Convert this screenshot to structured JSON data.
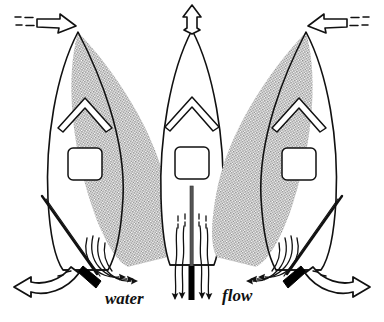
{
  "figure": {
    "caption_left_word": "water",
    "caption_right_word": "flow",
    "colors": {
      "ink": "#111111",
      "hull_stroke": "#111111",
      "shade_fill": "#9a9a9a",
      "background": "#ffffff",
      "rudder_fill": "#000000"
    }
  },
  "panels": [
    {
      "id": "left",
      "name": "boat-turning-left",
      "heading_arrow": "arrow-pointing-right-down-to-bow",
      "heading_arrow_style": "hollow-with-dashed-tail",
      "shaded_region": "swept-hull-rotated-counterclockwise",
      "rudder_state": "deflected-to-starboard",
      "turn_arrow": "curved-arrow-pointing-left",
      "deck_detail": "chevron",
      "cockpit": "square-cockpit"
    },
    {
      "id": "center",
      "name": "boat-going-straight",
      "heading_arrow": "arrow-pointing-up-from-bow",
      "heading_arrow_style": "hollow",
      "shaded_region": "none",
      "rudder_state": "centered",
      "turn_arrow": "none",
      "deck_detail": "chevron",
      "cockpit": "square-cockpit"
    },
    {
      "id": "right",
      "name": "boat-turning-right",
      "heading_arrow": "arrow-pointing-left-down-to-bow",
      "heading_arrow_style": "hollow-with-dashed-tail",
      "shaded_region": "swept-hull-rotated-clockwise",
      "rudder_state": "deflected-to-port",
      "turn_arrow": "curved-arrow-pointing-right",
      "deck_detail": "chevron",
      "cockpit": "square-cockpit"
    }
  ]
}
